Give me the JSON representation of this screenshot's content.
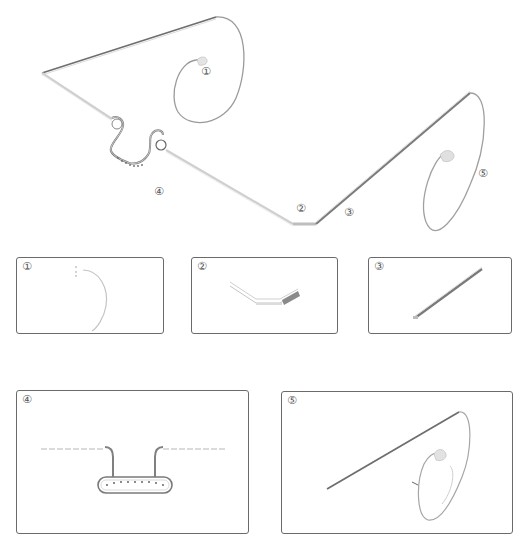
{
  "figure": {
    "stroke_color": "#8a8a8a",
    "dark_stroke_color": "#555555",
    "panel_border_color": "#6a6a6a"
  },
  "main_drawing": {
    "callouts": [
      {
        "id": "1",
        "label": "①",
        "part": "right lens rim"
      },
      {
        "id": "2",
        "label": "②",
        "part": "temple hinge bend"
      },
      {
        "id": "3",
        "label": "③",
        "part": "temple arm"
      },
      {
        "id": "4",
        "label": "④",
        "part": "nose bridge"
      },
      {
        "id": "5",
        "label": "⑤",
        "part": "left lens rim"
      }
    ]
  },
  "detail_panels": [
    {
      "id": "1",
      "label": "①",
      "part": "lens rim segment"
    },
    {
      "id": "2",
      "label": "②",
      "part": "bent hinge section"
    },
    {
      "id": "3",
      "label": "③",
      "part": "straight temple arm"
    },
    {
      "id": "4",
      "label": "④",
      "part": "nose bridge with pads"
    },
    {
      "id": "5",
      "label": "⑤",
      "part": "temple and lens rim assembly"
    }
  ]
}
